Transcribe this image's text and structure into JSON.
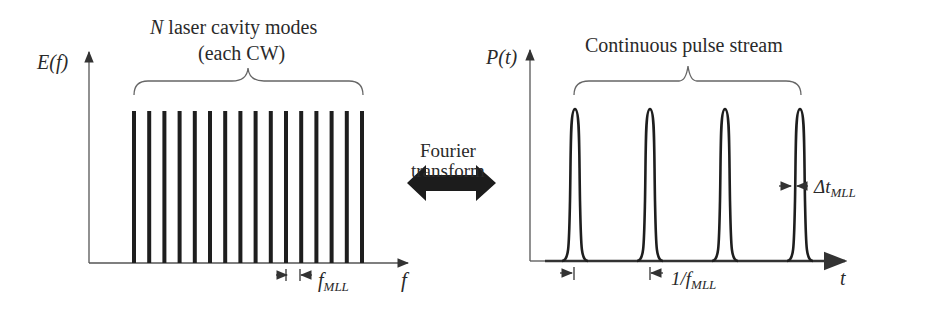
{
  "colors": {
    "ink": "#222222",
    "axis": "#555555",
    "background": "#ffffff"
  },
  "left_panel": {
    "y_axis_label": "E(f)",
    "x_axis_label": "f",
    "title_line1_italic": "N",
    "title_line1_rest": " laser cavity modes",
    "title_line2": "(each CW)",
    "spacing_label_main": "f",
    "spacing_label_sub": "MLL",
    "mode_count": 16
  },
  "center": {
    "line1": "Fourier",
    "line2": "transform",
    "arrow_icon": "double-headed-arrow"
  },
  "right_panel": {
    "y_axis_label": "P(t)",
    "x_axis_label": "t",
    "title": "Continuous pulse stream",
    "period_label_main": "1/f",
    "period_label_sub": "MLL",
    "width_label_main": "Δt",
    "width_label_sub": "MLL",
    "pulse_count": 4
  },
  "chart_data": [
    {
      "type": "bar",
      "title": "N laser cavity modes (each CW)",
      "xlabel": "f",
      "ylabel": "E(f)",
      "categories": [
        "m1",
        "m2",
        "m3",
        "m4",
        "m5",
        "m6",
        "m7",
        "m8",
        "m9",
        "m10",
        "m11",
        "m12",
        "m13",
        "m14",
        "m15",
        "m16"
      ],
      "values": [
        1,
        1,
        1,
        1,
        1,
        1,
        1,
        1,
        1,
        1,
        1,
        1,
        1,
        1,
        1,
        1
      ],
      "annotations": [
        "mode spacing f_MLL"
      ],
      "grid": false
    },
    {
      "type": "line",
      "title": "Continuous pulse stream",
      "xlabel": "t",
      "ylabel": "P(t)",
      "series": [
        {
          "name": "pulses",
          "peaks": [
            1,
            1,
            1,
            1
          ]
        }
      ],
      "annotations": [
        "period 1/f_MLL",
        "pulse width Δt_MLL"
      ],
      "grid": false
    }
  ]
}
